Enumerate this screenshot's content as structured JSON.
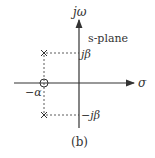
{
  "diagram": {
    "plane_label": "s-plane",
    "axes": {
      "vertical": "jω",
      "horizontal": "σ"
    },
    "labels": {
      "pos_freq": "jβ",
      "neg_freq": "−jβ",
      "neg_alpha": "−α"
    },
    "caption": "(b)",
    "markers": [
      {
        "type": "pole",
        "symbol": "×",
        "at": "−α + jβ"
      },
      {
        "type": "pole",
        "symbol": "×",
        "at": "−α − jβ"
      },
      {
        "type": "zero",
        "symbol": "○",
        "at": "−α"
      }
    ],
    "colors": {
      "ink": "#333333",
      "background": "#ffffff"
    }
  }
}
